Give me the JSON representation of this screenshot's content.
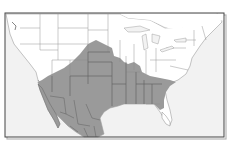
{
  "map": {
    "title": "",
    "region": "United States and Mexico",
    "type": "species range distribution map",
    "colors": {
      "background": "#ffffff",
      "ocean": "#f2f2f2",
      "land": "#ffffff",
      "range_fill": "#9a9a9a",
      "state_borders": "#8a8a8a",
      "range_borders": "#555555",
      "frame": "#444444",
      "frame_shadow": "#9a9a9a"
    },
    "legend": [],
    "labels": []
  }
}
